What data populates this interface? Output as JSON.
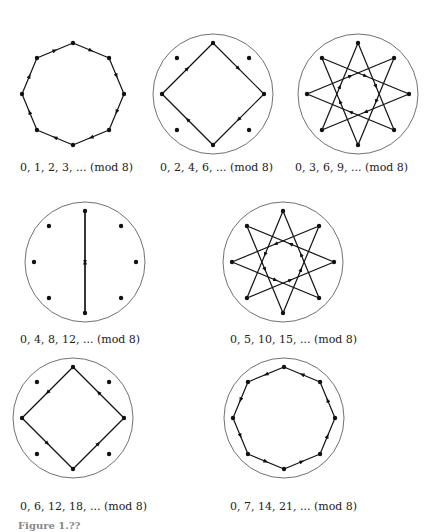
{
  "figure": {
    "caption": "Figure 1.??",
    "panels": [
      {
        "id": "p1",
        "label": "0, 1, 2, 3, ... (mod 8)",
        "step": 1,
        "cx": 73,
        "cy": 94,
        "r": 51,
        "capx": 20,
        "capy": 161
      },
      {
        "id": "p2",
        "label": "0, 2, 4, 6, ... (mod 8)",
        "step": 2,
        "cx": 213,
        "cy": 94,
        "r": 51,
        "capx": 160,
        "capy": 161
      },
      {
        "id": "p3",
        "label": "0, 3, 6, 9, ... (mod 8)",
        "step": 3,
        "cx": 358,
        "cy": 94,
        "r": 51,
        "capx": 295,
        "capy": 161
      },
      {
        "id": "p4",
        "label": "0, 4, 8, 12, ... (mod 8)",
        "step": 4,
        "cx": 85,
        "cy": 262,
        "r": 51,
        "capx": 20,
        "capy": 333
      },
      {
        "id": "p5",
        "label": "0, 5, 10, 15, ... (mod 8)",
        "step": 5,
        "cx": 283,
        "cy": 262,
        "r": 51,
        "capx": 230,
        "capy": 333
      },
      {
        "id": "p6",
        "label": "0, 6, 12, 18, ... (mod 8)",
        "step": 6,
        "cx": 73,
        "cy": 418,
        "r": 51,
        "capx": 20,
        "capy": 500
      },
      {
        "id": "p7",
        "label": "0, 7, 14, 21, ... (mod 8)",
        "step": 7,
        "cx": 284,
        "cy": 418,
        "r": 51,
        "capx": 230,
        "capy": 500
      }
    ]
  }
}
